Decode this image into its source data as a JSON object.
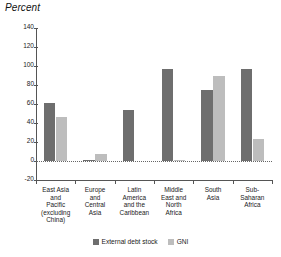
{
  "chart_data": {
    "type": "bar",
    "title": "",
    "ylabel": "Percent",
    "xlabel": "",
    "ylim": [
      -20,
      140
    ],
    "yticks": [
      -20,
      0,
      20,
      40,
      60,
      80,
      100,
      120,
      140
    ],
    "grid": false,
    "legend_position": "bottom",
    "categories": [
      "East Asia\nand\nPacific\n(excluding\nChina)",
      "Europe\nand\nCentral\nAsia",
      "Latin\nAmerica\nand the\nCaribbean",
      "Middle\nEast and\nNorth\nAfrica",
      "South\nAsia",
      "Sub-\nSaharan\nAfrica"
    ],
    "series": [
      {
        "name": "External debt stock",
        "color": "#6e6e6e",
        "values": [
          61,
          1.5,
          54,
          97,
          75,
          97
        ]
      },
      {
        "name": "GNI",
        "color": "#bdbdbd",
        "values": [
          46,
          7,
          0,
          1.5,
          90,
          23
        ]
      }
    ]
  },
  "legend": {
    "items": [
      {
        "label": "External debt stock",
        "color": "#6e6e6e"
      },
      {
        "label": "GNI",
        "color": "#bdbdbd"
      }
    ]
  }
}
